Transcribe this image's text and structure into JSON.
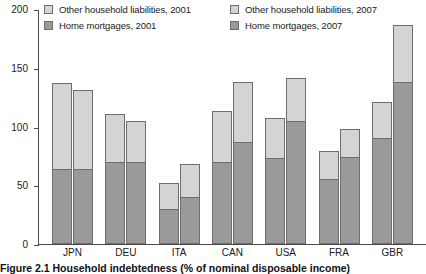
{
  "caption": "Figure 2.1  Household indebtedness (% of nominal disposable income)",
  "legend": {
    "items": [
      {
        "label": "Other household liabilities, 2001",
        "swatch": "other-2001-swatch",
        "color": "#d4d4d4"
      },
      {
        "label": "Other household liabilities, 2007",
        "swatch": "other-2007-swatch",
        "color": "#d4d4d4"
      },
      {
        "label": "Home mortgages, 2001",
        "swatch": "mortgages-2001-swatch",
        "color": "#9a9a9a"
      },
      {
        "label": "Home mortgages, 2007",
        "swatch": "mortgages-2007-swatch",
        "color": "#9a9a9a"
      }
    ]
  },
  "axis": {
    "yticks": [
      "0",
      "50",
      "100",
      "150",
      "200"
    ],
    "xticks": [
      "JPN",
      "DEU",
      "ITA",
      "CAN",
      "USA",
      "FRA",
      "GBR"
    ]
  },
  "chart_data": {
    "type": "bar",
    "title": "Figure 2.1  Household indebtedness (% of nominal disposable income)",
    "xlabel": "",
    "ylabel": "",
    "ylim": [
      0,
      200
    ],
    "yticks": [
      0,
      50,
      100,
      150,
      200
    ],
    "grid": false,
    "stacked": true,
    "grouped": true,
    "legend_position": "top",
    "legend_columns": 2,
    "categories": [
      "JPN",
      "DEU",
      "ITA",
      "CAN",
      "USA",
      "FRA",
      "GBR"
    ],
    "groups": [
      "2001",
      "2007"
    ],
    "series": [
      {
        "name": "Home mortgages, 2001",
        "group": "2001",
        "stack_order": 0,
        "color": "#9a9a9a",
        "values": [
          64,
          70,
          30,
          70,
          73,
          55,
          90
        ]
      },
      {
        "name": "Other household liabilities, 2001",
        "group": "2001",
        "stack_order": 1,
        "color": "#d4d4d4",
        "values": [
          73,
          41,
          22,
          43,
          34,
          24,
          31
        ]
      },
      {
        "name": "Home mortgages, 2007",
        "group": "2007",
        "stack_order": 0,
        "color": "#9a9a9a",
        "values": [
          64,
          70,
          40,
          87,
          105,
          74,
          138
        ]
      },
      {
        "name": "Other household liabilities, 2007",
        "group": "2007",
        "stack_order": 1,
        "color": "#d4d4d4",
        "values": [
          67,
          35,
          28,
          51,
          36,
          24,
          48
        ]
      }
    ],
    "totals": {
      "2001": [
        137,
        111,
        52,
        113,
        107,
        79,
        121
      ],
      "2007": [
        131,
        105,
        68,
        138,
        141,
        98,
        186
      ]
    }
  },
  "bars": [
    {
      "cat": "JPN",
      "y2001_total": 137,
      "y2001_mort": 64,
      "y2007_total": 131,
      "y2007_mort": 64
    },
    {
      "cat": "DEU",
      "y2001_total": 111,
      "y2001_mort": 70,
      "y2007_total": 105,
      "y2007_mort": 70
    },
    {
      "cat": "ITA",
      "y2001_total": 52,
      "y2001_mort": 30,
      "y2007_total": 68,
      "y2007_mort": 40
    },
    {
      "cat": "CAN",
      "y2001_total": 113,
      "y2001_mort": 70,
      "y2007_total": 138,
      "y2007_mort": 87
    },
    {
      "cat": "USA",
      "y2001_total": 107,
      "y2001_mort": 73,
      "y2007_total": 141,
      "y2007_mort": 105
    },
    {
      "cat": "FRA",
      "y2001_total": 79,
      "y2001_mort": 55,
      "y2007_total": 98,
      "y2007_mort": 74
    },
    {
      "cat": "GBR",
      "y2001_total": 121,
      "y2001_mort": 90,
      "y2007_total": 186,
      "y2007_mort": 138
    }
  ]
}
